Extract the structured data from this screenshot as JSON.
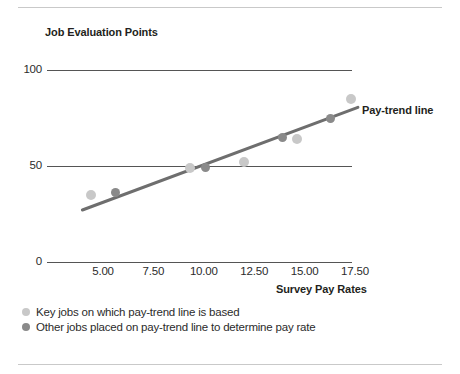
{
  "figure": {
    "y_axis_title": "Job Evaluation Points",
    "x_axis_title": "Survey Pay Rates",
    "trend_annotation": "Pay-trend line"
  },
  "legend": {
    "items": [
      {
        "marker": "key-job-dot",
        "label": "Key jobs on which pay-trend line is based",
        "color": "#c8c8c8"
      },
      {
        "marker": "other-job-dot",
        "label": "Other jobs placed on pay-trend line to determine pay rate",
        "color": "#8a8a8a"
      }
    ]
  },
  "chart_data": {
    "type": "scatter",
    "title": "",
    "xlabel": "Survey Pay Rates",
    "ylabel": "Job Evaluation Points",
    "xlim": [
      3.0,
      18.5
    ],
    "ylim": [
      0,
      100
    ],
    "grid": true,
    "gridlines_y": [
      0,
      50,
      100
    ],
    "xticks": [
      5.0,
      7.5,
      10.0,
      12.5,
      15.0,
      17.5
    ],
    "xtick_labels": [
      "5.00",
      "7.50",
      "10.00",
      "12.50",
      "15.00",
      "17.50"
    ],
    "yticks": [
      0,
      50,
      100
    ],
    "ytick_labels": [
      "0",
      "50",
      "100"
    ],
    "legend_position": "below-axis-left",
    "series": [
      {
        "name": "Key jobs on which pay-trend line is based",
        "marker_color": "#c8c8c8",
        "points": [
          {
            "x": 4.4,
            "y": 35
          },
          {
            "x": 9.3,
            "y": 49
          },
          {
            "x": 12.0,
            "y": 52
          },
          {
            "x": 14.6,
            "y": 64
          },
          {
            "x": 17.3,
            "y": 85
          }
        ]
      },
      {
        "name": "Other jobs placed on pay-trend line to determine pay rate",
        "marker_color": "#8a8a8a",
        "points": [
          {
            "x": 5.6,
            "y": 36
          },
          {
            "x": 10.1,
            "y": 49
          },
          {
            "x": 13.9,
            "y": 65
          },
          {
            "x": 16.3,
            "y": 75
          }
        ]
      }
    ],
    "trendline": {
      "name": "Pay-trend line",
      "color": "#6e6e6e",
      "x_start": 3.9,
      "y_start": 27,
      "x_end": 17.7,
      "y_end": 81
    }
  }
}
